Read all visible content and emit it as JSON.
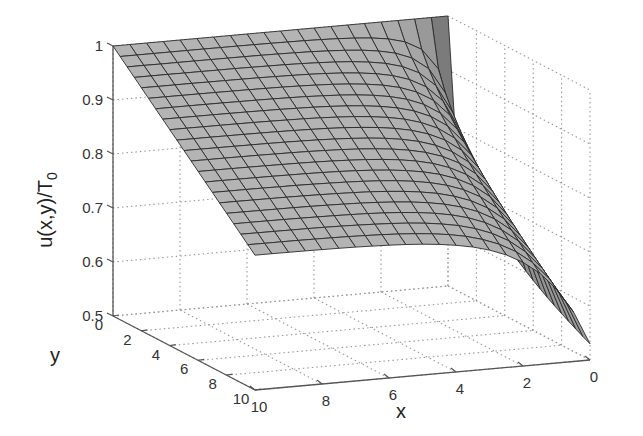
{
  "chart_data": {
    "type": "surface3d",
    "title": "",
    "xlabel": "x",
    "ylabel": "y",
    "zlabel": "u(x,y)/T",
    "zlabel_subscript": "0",
    "x_ticks": [
      0,
      2,
      4,
      6,
      8,
      10
    ],
    "y_ticks": [
      0,
      2,
      4,
      6,
      8,
      10
    ],
    "z_ticks": [
      0.5,
      0.6,
      0.7,
      0.8,
      0.9,
      1
    ],
    "x_range": [
      0,
      10
    ],
    "y_range": [
      0,
      10
    ],
    "z_range": [
      0.5,
      1
    ],
    "grid": true,
    "mesh": {
      "nx": 21,
      "ny": 11
    },
    "surface_color": "#a8a8a8",
    "mesh_color": "#2a2a2a",
    "corner_values": {
      "u(x=0,y=0)": 1.0,
      "u(x=10,y=0)": 1.0,
      "u(x=10,y=10)": 0.75,
      "u(x=0,y=10)": 0.53
    }
  }
}
